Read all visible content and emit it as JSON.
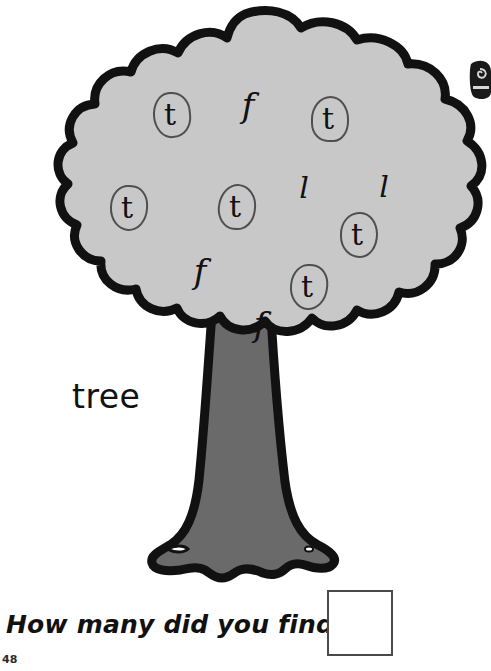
{
  "worksheet": {
    "word_label": "tree",
    "question": "How many did you find?",
    "page_number": "48",
    "answer_box_value": "",
    "target_letter": "t",
    "colors": {
      "canopy_fill": "#c8c8c8",
      "trunk_fill": "#6a6a6a",
      "outline": "#111111",
      "ring": "#4f4f4f",
      "text": "#111111",
      "answer_box_border": "#4a4a4a",
      "background": "#ffffff"
    }
  },
  "letters": [
    {
      "char": "t",
      "circled": true,
      "x": 160,
      "y": 100,
      "size": 30
    },
    {
      "char": "f",
      "circled": false,
      "x": 238,
      "y": 88,
      "size": 34
    },
    {
      "char": "t",
      "circled": true,
      "x": 318,
      "y": 104,
      "size": 30
    },
    {
      "char": "t",
      "circled": true,
      "x": 117,
      "y": 193,
      "size": 30
    },
    {
      "char": "t",
      "circled": true,
      "x": 225,
      "y": 192,
      "size": 30
    },
    {
      "char": "l",
      "circled": false,
      "x": 294,
      "y": 173,
      "size": 30
    },
    {
      "char": "l",
      "circled": false,
      "x": 374,
      "y": 172,
      "size": 30
    },
    {
      "char": "t",
      "circled": true,
      "x": 347,
      "y": 220,
      "size": 30
    },
    {
      "char": "f",
      "circled": false,
      "x": 190,
      "y": 254,
      "size": 34
    },
    {
      "char": "t",
      "circled": true,
      "x": 297,
      "y": 272,
      "size": 30
    },
    {
      "char": "f",
      "circled": false,
      "x": 250,
      "y": 307,
      "size": 34
    }
  ],
  "counts": {
    "circled_t": 7,
    "uncircled_f": 3,
    "uncircled_l": 2,
    "total_letters": 12
  }
}
